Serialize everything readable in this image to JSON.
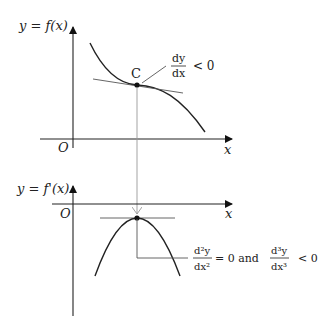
{
  "top_graph": {
    "y_label": "y = f(x)",
    "x_label": "x",
    "origin_label": "O",
    "point_label": "C",
    "annotation": {
      "numerator": "dy",
      "denominator": "dx",
      "relation": "< 0"
    }
  },
  "bottom_graph": {
    "y_label": "y = f'(x)",
    "x_label": "x",
    "origin_label": "O",
    "annotation": {
      "first": {
        "numerator": "d²y",
        "denominator": "dx²",
        "relation": "= 0 and"
      },
      "second": {
        "numerator": "d³y",
        "denominator": "dx³",
        "relation": "< 0"
      }
    }
  }
}
